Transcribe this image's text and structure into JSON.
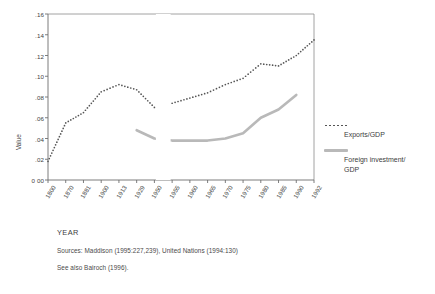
{
  "chart_data": {
    "type": "line",
    "title": "",
    "xlabel": "YEAR",
    "ylabel": "Value",
    "ylim": [
      0,
      0.16
    ],
    "y_ticks": [
      0.0,
      0.02,
      0.04,
      0.06,
      0.08,
      0.1,
      0.12,
      0.14,
      0.16
    ],
    "y_tick_labels": [
      "0 00",
      ".02",
      ".04",
      ".06",
      ".08",
      ".10",
      ".12",
      ".14",
      ".16"
    ],
    "categories": [
      "1800",
      "1870",
      "1881",
      "1900",
      "1913",
      "1929",
      "1950",
      "1955",
      "1960",
      "1965",
      "1970",
      "1975",
      "1980",
      "1985",
      "1990",
      "1992"
    ],
    "grid": false,
    "legend_position": "right",
    "series": [
      {
        "name": "Exports/GDP",
        "style": "dotted",
        "color": "#555555",
        "values": [
          0.018,
          0.055,
          0.065,
          0.085,
          0.092,
          0.087,
          0.07,
          0.074,
          0.079,
          0.084,
          0.092,
          0.098,
          0.112,
          0.11,
          0.12,
          0.135
        ]
      },
      {
        "name": "Foreign Investment/GDP",
        "style": "solid-thick",
        "color": "#b9b9b9",
        "values": [
          null,
          null,
          null,
          null,
          null,
          0.048,
          0.04,
          0.038,
          0.038,
          0.038,
          0.04,
          0.045,
          0.06,
          0.068,
          0.082,
          null
        ]
      }
    ]
  },
  "axis": {
    "y_title": "Value",
    "x_title": "YEAR"
  },
  "legend": {
    "entries": [
      {
        "label": "Exports/GDP",
        "swatch": "dotted-line-swatch"
      },
      {
        "label": "Foreign investment/\nGDP",
        "swatch": "gray-line-swatch"
      }
    ]
  },
  "caption": {
    "sources": "Sources: Maddison (1995:227,239), United Nations (1994:130)",
    "see_also": "See also Bairoch (1996)."
  }
}
